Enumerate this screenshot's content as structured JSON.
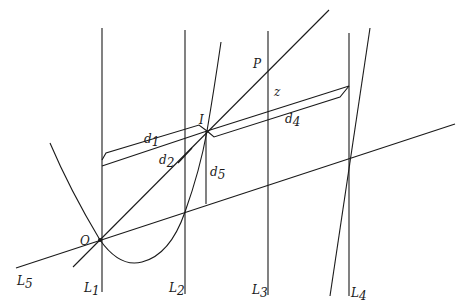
{
  "figure": {
    "labels": {
      "O": "O",
      "I": "I",
      "P": "P",
      "z": "z",
      "L1": {
        "base": "L",
        "sub": "1"
      },
      "L2": {
        "base": "L",
        "sub": "2"
      },
      "L3": {
        "base": "L",
        "sub": "3"
      },
      "L4": {
        "base": "L",
        "sub": "4"
      },
      "L5": {
        "base": "L",
        "sub": "5"
      },
      "d1": {
        "base": "d",
        "sub": "1"
      },
      "d2": {
        "base": "d",
        "sub": "2"
      },
      "d4": {
        "base": "d",
        "sub": "4"
      },
      "d5": {
        "base": "d",
        "sub": "5"
      }
    },
    "stroke_color": "#1a1a1a",
    "background": "#ffffff"
  }
}
